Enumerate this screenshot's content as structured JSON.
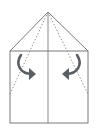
{
  "diagram": {
    "type": "origami-fold-step",
    "colors": {
      "background": "#ffffff",
      "outline": "#7a7a7a",
      "fold_line": "#8a8a8a",
      "arrow": "#5a5f63"
    },
    "shapes": {
      "apex": [
        48,
        12
      ],
      "rectangle": {
        "x": 10,
        "y": 51,
        "width": 78,
        "height": 72
      },
      "center_line": {
        "x": 48,
        "y1": 12,
        "y2": 123
      },
      "valley_folds": [
        {
          "from": [
            48,
            12
          ],
          "to": [
            10,
            94
          ]
        },
        {
          "from": [
            48,
            12
          ],
          "to": [
            88,
            94
          ]
        }
      ],
      "arrows": [
        {
          "side": "left",
          "direction": "inward-right"
        },
        {
          "side": "right",
          "direction": "inward-left"
        }
      ]
    }
  }
}
